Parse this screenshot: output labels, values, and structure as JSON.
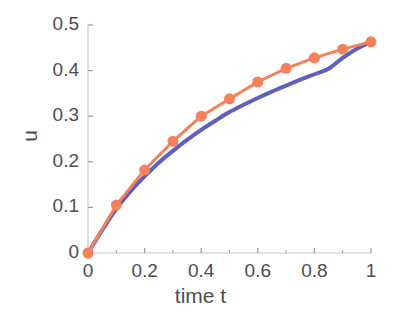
{
  "chart_data": {
    "type": "line",
    "title": "",
    "xlabel": "time t",
    "ylabel": "u",
    "xlim": [
      0,
      1
    ],
    "ylim": [
      0,
      0.5
    ],
    "grid": false,
    "legend": null,
    "x_ticks": [
      0,
      0.2,
      0.4,
      0.6,
      0.8,
      1
    ],
    "x_tick_labels": [
      "0",
      "0.2",
      "0.4",
      "0.6",
      "0.8",
      "1"
    ],
    "x_minor_ticks": [
      0.1,
      0.3,
      0.5,
      0.7,
      0.9
    ],
    "y_ticks": [
      0,
      0.1,
      0.2,
      0.3,
      0.4,
      0.5
    ],
    "y_tick_labels": [
      "0",
      "0.1",
      "0.2",
      "0.3",
      "0.4",
      "0.5"
    ],
    "series": [
      {
        "name": "numerical solution",
        "style": "line-with-circle-markers",
        "color": "#f4815c",
        "marker": "circle",
        "marker_size": 11,
        "line_width": 3,
        "x": [
          0,
          0.1,
          0.2,
          0.3,
          0.4,
          0.5,
          0.6,
          0.7,
          0.8,
          0.9,
          1
        ],
        "values": [
          0,
          0.105,
          0.182,
          0.245,
          0.3,
          0.338,
          0.375,
          0.405,
          0.428,
          0.447,
          0.463
        ]
      },
      {
        "name": "exact solution",
        "style": "smooth-line",
        "color": "#5f5fbf",
        "marker": "none",
        "line_width": 4,
        "x": [
          0,
          0.05,
          0.1,
          0.15,
          0.2,
          0.25,
          0.3,
          0.35,
          0.4,
          0.45,
          0.5,
          0.55,
          0.6,
          0.65,
          0.7,
          0.75,
          0.8,
          0.85,
          0.9,
          0.95,
          1
        ],
        "values": [
          0,
          0.05,
          0.097,
          0.135,
          0.168,
          0.198,
          0.224,
          0.248,
          0.27,
          0.29,
          0.309,
          0.325,
          0.34,
          0.354,
          0.367,
          0.38,
          0.392,
          0.404,
          0.428,
          0.448,
          0.463
        ]
      }
    ]
  },
  "axes": {
    "axis_color": "#c8c8c8",
    "tick_color": "#9a9a9a",
    "label_color": "#4d4d4d"
  }
}
